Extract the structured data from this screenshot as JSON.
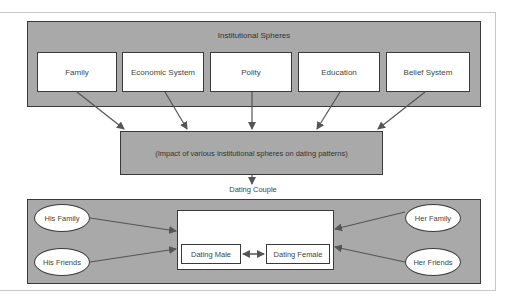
{
  "diagram": {
    "top_panel": {
      "title": "Institutional Spheres",
      "spheres": [
        {
          "label": "Family"
        },
        {
          "label": "Economic System"
        },
        {
          "label": "Polity"
        },
        {
          "label": "Education"
        },
        {
          "label": "Belief System"
        }
      ]
    },
    "middle_panel": {
      "label": "(Impact of various institutional spheres on dating patterns)"
    },
    "couple_label": "Dating Couple",
    "bottom_panel": {
      "left_influences": [
        {
          "label": "His Family"
        },
        {
          "label": "His Friends"
        }
      ],
      "right_influences": [
        {
          "label": "Her Family"
        },
        {
          "label": "Her Friends"
        }
      ],
      "couple": {
        "male": "Dating Male",
        "female": "Dating Female"
      }
    },
    "colors": {
      "panel_fill": "#a9a9a9",
      "box_fill": "#ffffff",
      "border": "#3a3a3a",
      "arrow": "#555555"
    }
  }
}
